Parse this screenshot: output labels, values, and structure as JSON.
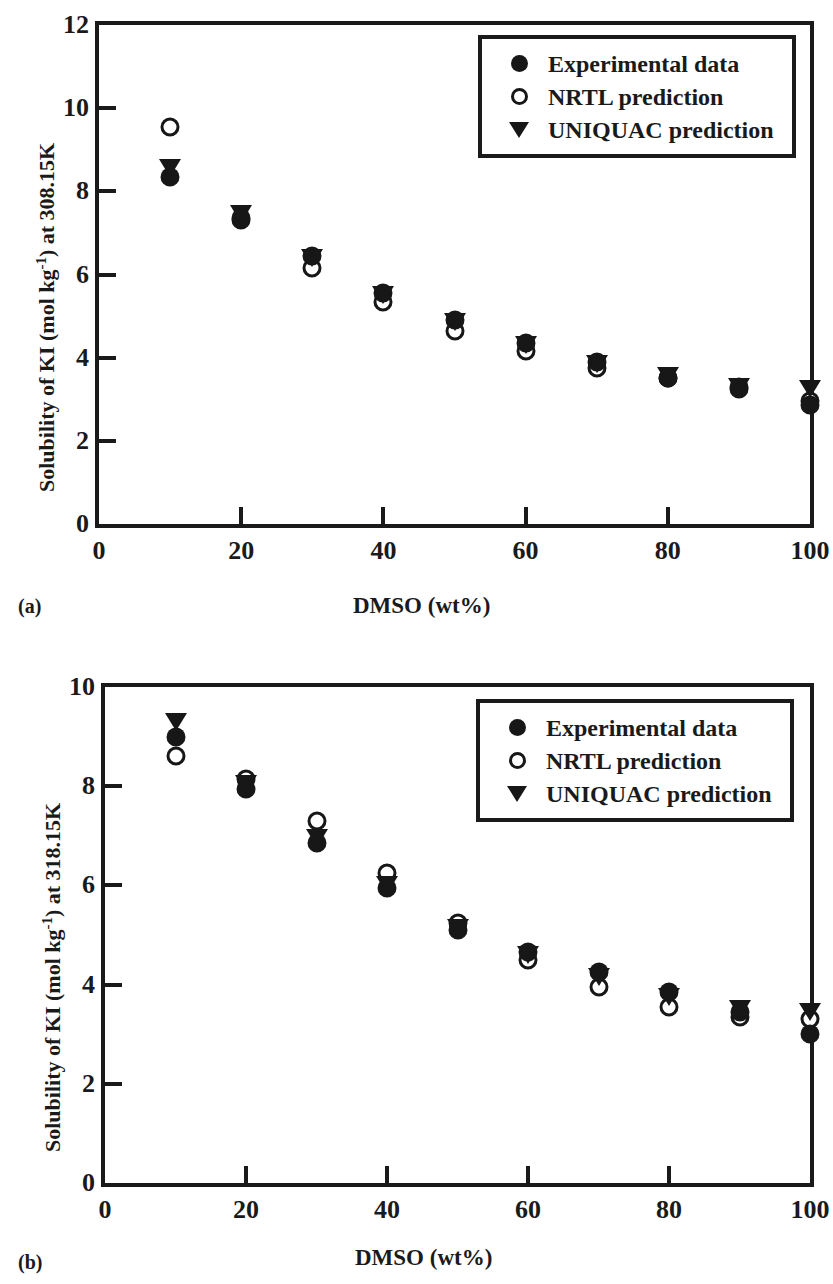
{
  "figures": [
    {
      "panel": "(a)",
      "legend": {
        "items": [
          {
            "symbol": "filled-circle",
            "label": "Experimental data"
          },
          {
            "symbol": "open-circle",
            "label": "NRTL prediction"
          },
          {
            "symbol": "filled-triangle-down",
            "label": "UNIQUAC prediction"
          }
        ]
      }
    },
    {
      "panel": "(b)",
      "legend": {
        "items": [
          {
            "symbol": "filled-circle",
            "label": "Experimental data"
          },
          {
            "symbol": "open-circle",
            "label": "NRTL prediction"
          },
          {
            "symbol": "filled-triangle-down",
            "label": "UNIQUAC prediction"
          }
        ]
      }
    }
  ],
  "chart_data": [
    {
      "type": "scatter",
      "panel": "(a)",
      "title": "",
      "xlabel": "DMSO (wt%)",
      "ylabel_plain": "Solubility of KI (mol kg-1) at 308.15K",
      "ylabel_prefix": "Solubility of KI (mol kg",
      "ylabel_sup": "-1",
      "ylabel_suffix": ") at 308.15K",
      "xlim": [
        0,
        100
      ],
      "ylim": [
        0,
        12
      ],
      "xticks": [
        0,
        20,
        40,
        60,
        80,
        100
      ],
      "yticks": [
        0,
        2,
        4,
        6,
        8,
        10,
        12
      ],
      "grid": false,
      "legend_position": "top-right",
      "x": [
        10,
        20,
        30,
        40,
        50,
        60,
        70,
        80,
        90,
        100
      ],
      "series": [
        {
          "name": "Experimental data",
          "symbol": "filled-circle",
          "values": [
            8.35,
            7.35,
            6.45,
            5.55,
            4.9,
            4.35,
            3.9,
            3.5,
            3.25,
            2.85
          ]
        },
        {
          "name": "NRTL prediction",
          "symbol": "open-circle",
          "values": [
            9.55,
            7.3,
            6.15,
            5.35,
            4.65,
            4.15,
            3.75,
            3.5,
            3.3,
            2.95
          ]
        },
        {
          "name": "UNIQUAC prediction",
          "symbol": "filled-triangle-down",
          "values": [
            8.55,
            7.45,
            6.4,
            5.5,
            4.85,
            4.3,
            3.85,
            3.55,
            3.3,
            3.25
          ]
        }
      ]
    },
    {
      "type": "scatter",
      "panel": "(b)",
      "title": "",
      "xlabel": "DMSO (wt%)",
      "ylabel_plain": "Solubility of KI (mol kg-1) at 318.15K",
      "ylabel_prefix": "Solubility of KI (mol kg",
      "ylabel_sup": "-1",
      "ylabel_suffix": ") at 318.15K",
      "xlim": [
        0,
        100
      ],
      "ylim": [
        0,
        10
      ],
      "xticks": [
        0,
        20,
        40,
        60,
        80,
        100
      ],
      "yticks": [
        0,
        2,
        4,
        6,
        8,
        10
      ],
      "grid": false,
      "legend_position": "top-right",
      "x": [
        10,
        20,
        30,
        40,
        50,
        60,
        70,
        80,
        90,
        100
      ],
      "series": [
        {
          "name": "Experimental data",
          "symbol": "filled-circle",
          "values": [
            9.0,
            7.95,
            6.85,
            5.95,
            5.1,
            4.65,
            4.25,
            3.85,
            3.45,
            3.0
          ]
        },
        {
          "name": "NRTL prediction",
          "symbol": "open-circle",
          "values": [
            8.6,
            8.15,
            7.3,
            6.25,
            5.25,
            4.5,
            3.95,
            3.55,
            3.35,
            3.3
          ]
        },
        {
          "name": "UNIQUAC prediction",
          "symbol": "filled-triangle-down",
          "values": [
            9.3,
            8.05,
            6.95,
            6.0,
            5.15,
            4.6,
            4.15,
            3.75,
            3.5,
            3.45
          ]
        }
      ]
    }
  ]
}
